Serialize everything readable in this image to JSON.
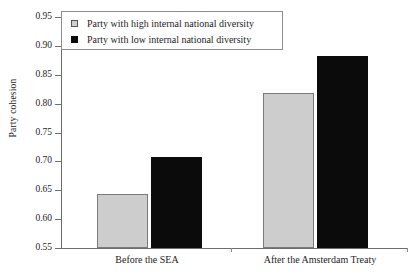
{
  "chart_data": {
    "type": "bar",
    "title": "",
    "subtitle": "",
    "xlabel": "",
    "ylabel": "Party cohesion",
    "categories": [
      "Before the SEA",
      "After the Amsterdam Treaty"
    ],
    "series": [
      {
        "name": "Party with high internal national diversity",
        "color": "#cdcdcd",
        "values": [
          0.643,
          0.818
        ]
      },
      {
        "name": "Party with low internal national diversity",
        "color": "#0b0b0b",
        "values": [
          0.708,
          0.882
        ]
      }
    ],
    "ylim": [
      0.55,
      0.95
    ],
    "ytick_step": 0.05,
    "yticks": [
      "0.95",
      "0.90",
      "0.85",
      "0.80",
      "0.75",
      "0.70",
      "0.65",
      "0.60",
      "0.55"
    ],
    "ytick_values": [
      0.95,
      0.9,
      0.85,
      0.8,
      0.75,
      0.7,
      0.65,
      0.6,
      0.55
    ],
    "grid": false,
    "legend_position": "top-left"
  },
  "legend": {
    "entries": [
      {
        "label": "Party with high internal national diversity",
        "swatch": "light-gray-square"
      },
      {
        "label": "Party with low internal national diversity",
        "swatch": "black-square"
      }
    ]
  },
  "axes": {
    "y_title": "Party cohesion",
    "x_categories": [
      "Before the SEA",
      "After the Amsterdam Treaty"
    ]
  }
}
